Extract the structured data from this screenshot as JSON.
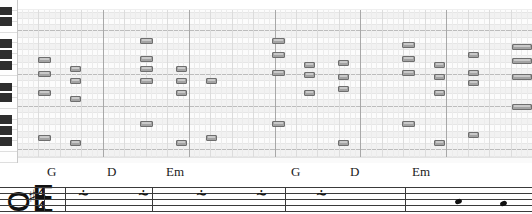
{
  "app": {
    "view_name": "piano-roll-editor",
    "colors": {
      "note_fill": "#a3a3a3",
      "note_border": "#6e6e6e",
      "lane_white": "#fcfcfc",
      "lane_black": "#f2f2f2",
      "bar_line": "#a8a8a8",
      "staff_ink": "#3a3a3a",
      "black_key": "#2e2e2e",
      "white_key": "#fefefe"
    }
  },
  "piano_roll": {
    "name": "piano-roll-grid",
    "bars": 6,
    "beats_per_bar": 4,
    "pitch_lanes": 26,
    "keyboard": {
      "name": "piano-keyboard",
      "white_key_count": 15,
      "black_key_count": 11
    },
    "notes": [
      {
        "x": 38,
        "y": 57,
        "w": 13
      },
      {
        "x": 38,
        "y": 71,
        "w": 13
      },
      {
        "x": 38,
        "y": 90,
        "w": 13
      },
      {
        "x": 38,
        "y": 135,
        "w": 13
      },
      {
        "x": 70,
        "y": 66,
        "w": 11
      },
      {
        "x": 70,
        "y": 78,
        "w": 11
      },
      {
        "x": 70,
        "y": 96,
        "w": 11
      },
      {
        "x": 70,
        "y": 140,
        "w": 11
      },
      {
        "x": 140,
        "y": 38,
        "w": 13
      },
      {
        "x": 140,
        "y": 56,
        "w": 13
      },
      {
        "x": 140,
        "y": 66,
        "w": 13
      },
      {
        "x": 140,
        "y": 78,
        "w": 13
      },
      {
        "x": 140,
        "y": 121,
        "w": 13
      },
      {
        "x": 176,
        "y": 66,
        "w": 11
      },
      {
        "x": 176,
        "y": 78,
        "w": 11
      },
      {
        "x": 176,
        "y": 90,
        "w": 11
      },
      {
        "x": 176,
        "y": 140,
        "w": 11
      },
      {
        "x": 206,
        "y": 78,
        "w": 11
      },
      {
        "x": 206,
        "y": 135,
        "w": 11
      },
      {
        "x": 272,
        "y": 38,
        "w": 13
      },
      {
        "x": 272,
        "y": 52,
        "w": 13
      },
      {
        "x": 272,
        "y": 70,
        "w": 13
      },
      {
        "x": 272,
        "y": 121,
        "w": 13
      },
      {
        "x": 304,
        "y": 62,
        "w": 11
      },
      {
        "x": 304,
        "y": 72,
        "w": 11
      },
      {
        "x": 304,
        "y": 90,
        "w": 11
      },
      {
        "x": 338,
        "y": 60,
        "w": 11
      },
      {
        "x": 338,
        "y": 74,
        "w": 11
      },
      {
        "x": 338,
        "y": 86,
        "w": 11
      },
      {
        "x": 338,
        "y": 140,
        "w": 11
      },
      {
        "x": 402,
        "y": 42,
        "w": 13
      },
      {
        "x": 402,
        "y": 56,
        "w": 13
      },
      {
        "x": 402,
        "y": 70,
        "w": 13
      },
      {
        "x": 402,
        "y": 121,
        "w": 13
      },
      {
        "x": 434,
        "y": 62,
        "w": 11
      },
      {
        "x": 434,
        "y": 74,
        "w": 11
      },
      {
        "x": 434,
        "y": 90,
        "w": 11
      },
      {
        "x": 434,
        "y": 140,
        "w": 11
      },
      {
        "x": 468,
        "y": 52,
        "w": 11
      },
      {
        "x": 468,
        "y": 70,
        "w": 11
      },
      {
        "x": 468,
        "y": 80,
        "w": 11
      },
      {
        "x": 468,
        "y": 132,
        "w": 11
      },
      {
        "x": 512,
        "y": 44,
        "w": 20
      },
      {
        "x": 512,
        "y": 58,
        "w": 20
      },
      {
        "x": 512,
        "y": 74,
        "w": 20
      },
      {
        "x": 512,
        "y": 104,
        "w": 20
      }
    ]
  },
  "notation": {
    "name": "music-staff",
    "clef": "ᴑE",
    "clef_name": "treble-clef",
    "key_signature": "♯",
    "key_signature_name": "sharp",
    "time_signature_top": "4",
    "time_signature_bottom": "4",
    "rest_glyph": "⸞",
    "chords": [
      {
        "label": "G",
        "x": 47
      },
      {
        "label": "D",
        "x": 107
      },
      {
        "label": "Em",
        "x": 166
      },
      {
        "label": "G",
        "x": 291
      },
      {
        "label": "D",
        "x": 350
      },
      {
        "label": "Em",
        "x": 412
      }
    ],
    "barlines_x": [
      44,
      65,
      152,
      285,
      405
    ],
    "rests_x": [
      78,
      138,
      196,
      256,
      316
    ]
  }
}
